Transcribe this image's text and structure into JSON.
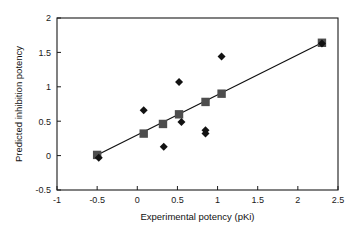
{
  "chart_data": {
    "type": "scatter",
    "title": "",
    "xlabel": "Experimental potency (pKi)",
    "ylabel": "Predicted inhibition potency",
    "xlim": [
      -1,
      2.5
    ],
    "ylim": [
      -0.5,
      2
    ],
    "xticks": [
      "-1",
      "-0.5",
      "0",
      "0.5",
      "1",
      "1.5",
      "2",
      "2.5"
    ],
    "xtick_values": [
      -1,
      -0.5,
      0,
      0.5,
      1,
      1.5,
      2,
      2.5
    ],
    "yticks": [
      "-0.5",
      "0",
      "0.5",
      "1",
      "1.5",
      "2"
    ],
    "ytick_values": [
      -0.5,
      0,
      0.5,
      1,
      1.5,
      2
    ],
    "grid": false,
    "legend": "none",
    "colors": {
      "square_marker": "#4d4d4d",
      "diamond_marker": "#121212",
      "trend_line": "#111111",
      "axis": "#1a1a1a",
      "background": "#ffffff"
    },
    "series": [
      {
        "name": "Predicted (squares)",
        "marker": "square",
        "color": "#4d4d4d",
        "points": [
          {
            "x": -0.5,
            "y": 0.01
          },
          {
            "x": 0.08,
            "y": 0.32
          },
          {
            "x": 0.32,
            "y": 0.46
          },
          {
            "x": 0.52,
            "y": 0.6
          },
          {
            "x": 0.85,
            "y": 0.78
          },
          {
            "x": 1.05,
            "y": 0.9
          },
          {
            "x": 2.3,
            "y": 1.64
          }
        ]
      },
      {
        "name": "Observed (diamonds)",
        "marker": "diamond",
        "color": "#121212",
        "points": [
          {
            "x": -0.48,
            "y": -0.03
          },
          {
            "x": 0.08,
            "y": 0.66
          },
          {
            "x": 0.33,
            "y": 0.13
          },
          {
            "x": 0.52,
            "y": 1.07
          },
          {
            "x": 0.55,
            "y": 0.49
          },
          {
            "x": 0.85,
            "y": 0.37
          },
          {
            "x": 0.85,
            "y": 0.32
          },
          {
            "x": 1.05,
            "y": 1.44
          },
          {
            "x": 2.3,
            "y": 1.63
          }
        ]
      }
    ],
    "trend_line": {
      "x_start": -0.5,
      "y_start": 0.01,
      "x_end": 2.3,
      "y_end": 1.64
    }
  }
}
